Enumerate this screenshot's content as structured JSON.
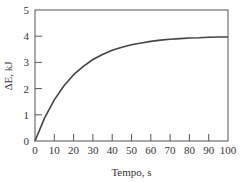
{
  "chart_data": {
    "type": "line",
    "title": "",
    "xlabel": "Tempo, s",
    "ylabel": "ΔE, kJ",
    "xlim": [
      0,
      100
    ],
    "ylim": [
      0,
      5
    ],
    "xticks": [
      0,
      10,
      20,
      30,
      40,
      50,
      60,
      70,
      80,
      90,
      100
    ],
    "yticks": [
      0,
      1,
      2,
      3,
      4,
      5
    ],
    "grid": false,
    "legend": null,
    "series": [
      {
        "name": "ΔE",
        "x": [
          0,
          5,
          10,
          15,
          20,
          25,
          30,
          35,
          40,
          45,
          50,
          55,
          60,
          65,
          70,
          75,
          80,
          85,
          90,
          95,
          100
        ],
        "y": [
          0,
          0.88,
          1.57,
          2.11,
          2.53,
          2.85,
          3.11,
          3.3,
          3.46,
          3.58,
          3.67,
          3.74,
          3.8,
          3.85,
          3.88,
          3.91,
          3.93,
          3.94,
          3.96,
          3.97,
          3.97
        ]
      }
    ],
    "colors": {
      "line": "#444444",
      "frame": "#555555"
    }
  }
}
